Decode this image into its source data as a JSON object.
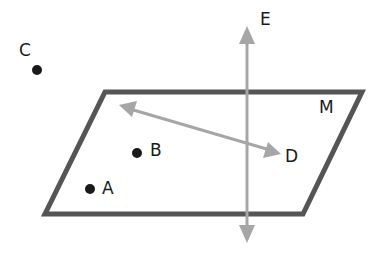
{
  "diagram": {
    "plane": {
      "label": "M",
      "corners": [
        [
          105,
          92
        ],
        [
          362,
          92
        ],
        [
          303,
          214
        ],
        [
          45,
          214
        ]
      ],
      "stroke": "#555555"
    },
    "line_E": {
      "label": "E",
      "x": 247,
      "y1": 27,
      "y2": 242,
      "stroke": "#a6a6a6",
      "arrowheads": "both"
    },
    "line_BD": {
      "from": [
        120,
        106
      ],
      "to": [
        280,
        153
      ],
      "stroke": "#a6a6a6",
      "arrowheads": "both",
      "end_label": "D"
    },
    "points": [
      {
        "label": "C",
        "x": 37,
        "y": 70
      },
      {
        "label": "B",
        "x": 137,
        "y": 153
      },
      {
        "label": "A",
        "x": 90,
        "y": 189
      }
    ],
    "labels": {
      "E": "E",
      "M": "M",
      "D": "D",
      "A": "A",
      "B": "B",
      "C": "C"
    }
  }
}
